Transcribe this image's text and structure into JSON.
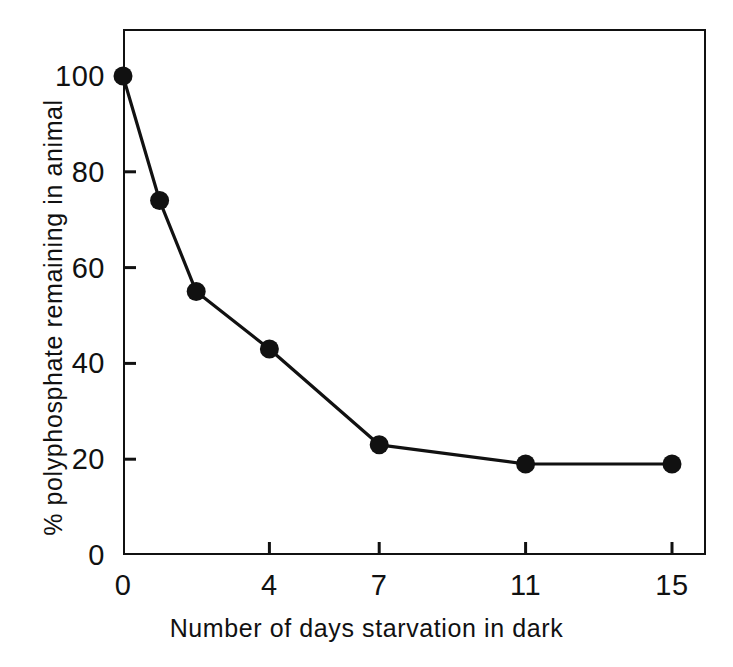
{
  "figure": {
    "background_color": "#ffffff",
    "ink_color": "#111111"
  },
  "chart_data": {
    "type": "line",
    "title": "",
    "subtitle": "",
    "xlabel": "Number of days starvation in dark",
    "ylabel": "% polyphosphate remaining in animal",
    "x": [
      0,
      1,
      2,
      4,
      7,
      11,
      15
    ],
    "values": [
      100,
      74,
      55,
      43,
      23,
      19,
      19
    ],
    "series": [
      {
        "name": "% polyphosphate remaining in animal",
        "x": [
          0,
          1,
          2,
          4,
          7,
          11,
          15
        ],
        "values": [
          100,
          74,
          55,
          43,
          23,
          19,
          19
        ]
      }
    ],
    "xlim": [
      0,
      16
    ],
    "ylim": [
      0,
      110
    ],
    "xticks": [
      0,
      4,
      7,
      11,
      15
    ],
    "xtick_labels": [
      "0",
      "4",
      "7",
      "11",
      "15"
    ],
    "yticks": [
      0,
      20,
      40,
      60,
      80,
      100
    ],
    "ytick_labels": [
      "0",
      "20",
      "40",
      "60",
      "80",
      "100"
    ],
    "grid": false,
    "legend": false,
    "legend_position": "none",
    "marker": "filled-circle",
    "marker_color": "#111111",
    "line_color": "#111111",
    "annotations": []
  }
}
